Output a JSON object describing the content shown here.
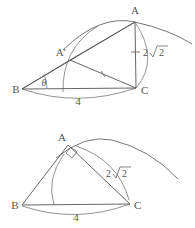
{
  "figures": [
    {
      "name": "triangle-with-rotated-vertex",
      "labels": {
        "vertex_a": "A",
        "vertex_a_prime": "A′",
        "vertex_b": "B",
        "vertex_c": "C",
        "angle_theta": "θ",
        "side_ac_length": "2√2",
        "side_ac_coeff": "2",
        "side_ac_radicand": "2",
        "side_bc_length": "4"
      }
    },
    {
      "name": "right-triangle-at-a",
      "labels": {
        "vertex_a": "A",
        "vertex_b": "B",
        "vertex_c": "C",
        "side_ac_length": "2√2",
        "side_ac_coeff": "2",
        "side_ac_radicand": "2",
        "side_bc_length": "4",
        "right_angle_marker": "right-angle"
      }
    }
  ],
  "colors": {
    "ink": "#555555",
    "arc": "#666666",
    "background": "#ffffff"
  }
}
